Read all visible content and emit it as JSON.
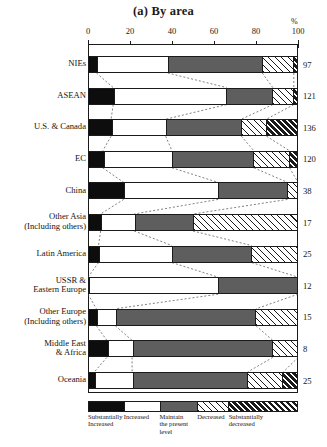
{
  "title": "(a) By area",
  "axis": {
    "unit": "%",
    "ticks": [
      0,
      20,
      40,
      60,
      80,
      100
    ],
    "min": 0,
    "max": 100
  },
  "legend": {
    "items": [
      {
        "key": "sub_increased",
        "label": "Substantially\nIncreased",
        "pattern": "solid-black",
        "color": "#0d0d0d"
      },
      {
        "key": "increased",
        "label": "Increased",
        "pattern": "white",
        "color": "#ffffff"
      },
      {
        "key": "maintain",
        "label": "Maintain\nthe present\nlevel",
        "pattern": "solid-gray",
        "color": "#5e5e5e"
      },
      {
        "key": "decreased",
        "label": "Decreased",
        "pattern": "hatch-light",
        "color": "#ffffff"
      },
      {
        "key": "sub_decreased",
        "label": "Substantially\ndecreased",
        "pattern": "hatch-heavy",
        "color": "#1a1a1a"
      }
    ],
    "widths": [
      17,
      17,
      18,
      15,
      33
    ]
  },
  "chart_data": {
    "type": "bar",
    "orientation": "horizontal",
    "stacked": true,
    "normalized": true,
    "title": "(a) By area",
    "xlabel": "%",
    "ylabel": "",
    "xlim": [
      0,
      100
    ],
    "grid": false,
    "legend_position": "bottom",
    "series": [
      {
        "name": "Substantially Increased",
        "values": [
          4,
          12,
          11,
          7,
          17,
          6,
          5,
          0,
          4,
          9,
          3
        ]
      },
      {
        "name": "Increased",
        "values": [
          34,
          54,
          26,
          33,
          45,
          16,
          35,
          62,
          9,
          12,
          18
        ]
      },
      {
        "name": "Maintain the present level",
        "values": [
          45,
          22,
          36,
          39,
          33,
          28,
          38,
          38,
          67,
          67,
          55
        ]
      },
      {
        "name": "Decreased",
        "values": [
          15,
          10,
          12,
          17,
          5,
          50,
          22,
          0,
          20,
          12,
          17
        ]
      },
      {
        "name": "Substantially decreased",
        "values": [
          2,
          2,
          15,
          4,
          0,
          0,
          0,
          0,
          0,
          0,
          7
        ]
      }
    ],
    "categories": [
      "NIEs",
      "ASEAN",
      "U.S. & Canada",
      "EC",
      "China",
      "Other Asia\n(Including others)",
      "Latin America",
      "USSR &\nEastern Europe",
      "Other Europe\n(Including others)",
      "Middle East\n& Africa",
      "Oceania"
    ],
    "counts": [
      97,
      121,
      136,
      120,
      38,
      17,
      25,
      12,
      15,
      8,
      25
    ]
  }
}
